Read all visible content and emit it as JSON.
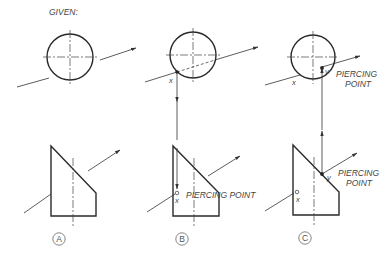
{
  "title": "GIVEN:",
  "views": [
    {
      "id": "A",
      "label": "A"
    },
    {
      "id": "B",
      "label": "B",
      "point_label": "x",
      "annotation": "PIERCING POINT"
    },
    {
      "id": "C",
      "label": "C",
      "point_x_label": "x",
      "point_y_label": "y",
      "annotation_line1": "PIERCING",
      "annotation_line2": "POINT"
    }
  ],
  "colors": {
    "line": "#2a2a2a",
    "text": "#444444"
  }
}
